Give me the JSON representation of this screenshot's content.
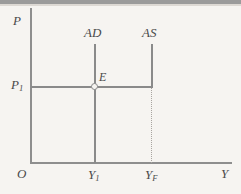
{
  "chart_data": {
    "type": "line",
    "title": "",
    "xlabel": "Y",
    "ylabel": "P",
    "origin_label": "O",
    "grid": false,
    "legend": "none",
    "xlim": [
      0,
      100
    ],
    "ylim": [
      0,
      100
    ],
    "x_tick_labels": [
      "Y",
      "Y"
    ],
    "x_tick_subscripts": [
      "1",
      "F"
    ],
    "y_tick_labels": [
      "P"
    ],
    "y_tick_subscripts": [
      "1"
    ],
    "series": [
      {
        "name": "AD",
        "label": "AD",
        "orientation": "vertical",
        "x": 95,
        "y_from": 44,
        "y_to": 163
      },
      {
        "name": "AS",
        "label": "AS",
        "orientation": "vertical-then-horizontal",
        "x": 152,
        "y_from": 44,
        "y_to": 87,
        "horizontal_y": 87,
        "horizontal_x_from": 31,
        "horizontal_x_to": 152
      }
    ],
    "annotations": [
      {
        "name": "equilibrium-point",
        "label": "E",
        "x": 95,
        "y": 87,
        "marker": "open-circle"
      },
      {
        "name": "full-employment-dropline",
        "label": "",
        "style": "dotted",
        "x": 152,
        "y_from": 87,
        "y_to": 163
      }
    ]
  },
  "labels": {
    "price_axis": "P",
    "output_axis": "Y",
    "origin": "O",
    "price_level": "P",
    "price_level_sub": "1",
    "aggregate_demand": "AD",
    "aggregate_supply": "AS",
    "equilibrium": "E",
    "output_equilibrium": "Y",
    "output_equilibrium_sub": "1",
    "output_full_employment": "Y",
    "output_full_employment_sub": "F"
  },
  "colors": {
    "background": "#f6f4f1",
    "axis": "#8e8e8e",
    "curve": "#8a8a8a",
    "dotted": "#a8a4a0",
    "text": "#4a4a4a",
    "page_edge": "#9b9b9b"
  }
}
